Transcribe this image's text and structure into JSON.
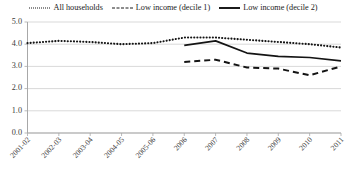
{
  "chart_data": {
    "type": "line",
    "title": "",
    "xlabel": "",
    "ylabel": "",
    "ylim": [
      0.0,
      5.0
    ],
    "ytick_labels": [
      "0.0",
      "1.0",
      "2.0",
      "3.0",
      "4.0",
      "5.0"
    ],
    "ytick_values": [
      0.0,
      1.0,
      2.0,
      3.0,
      4.0,
      5.0
    ],
    "grid": true,
    "legend_position": "top-center",
    "categories": [
      "2001-02",
      "2002-03",
      "2003-04",
      "2004-05",
      "2005-06",
      "2006",
      "2007",
      "2008",
      "2009",
      "2010",
      "2011"
    ],
    "series": [
      {
        "name": "All households",
        "style": "dotted",
        "color": "#141414",
        "values": [
          4.05,
          4.15,
          4.1,
          4.0,
          4.05,
          4.3,
          4.3,
          4.2,
          4.1,
          4.0,
          3.85
        ]
      },
      {
        "name": "Low income (decile 1)",
        "style": "dashed",
        "color": "#141414",
        "values": [
          null,
          null,
          null,
          null,
          null,
          3.2,
          3.3,
          2.95,
          2.9,
          2.6,
          3.0
        ]
      },
      {
        "name": "Low income (decile 2)",
        "style": "solid",
        "color": "#141414",
        "values": [
          null,
          null,
          null,
          null,
          null,
          3.95,
          4.15,
          3.6,
          3.45,
          3.4,
          3.25
        ]
      }
    ]
  },
  "legend": {
    "items": [
      {
        "label": "All households",
        "marker": "dotted-line-icon"
      },
      {
        "label": "Low income (decile 1)",
        "marker": "dashed-line-icon"
      },
      {
        "label": "Low income (decile 2)",
        "marker": "solid-line-icon"
      }
    ]
  },
  "colors": {
    "series": "#141414",
    "grid": "#c9c9c9",
    "axis": "#a8a8a8",
    "text": "#3a3a3a",
    "background": "#ffffff"
  }
}
